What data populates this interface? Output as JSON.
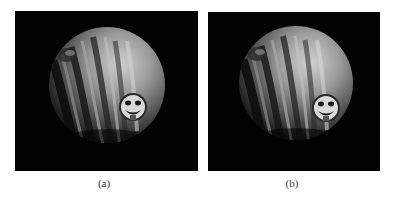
{
  "figure": {
    "subfigures": [
      {
        "id": "a",
        "caption": "(a)",
        "content": "rendered sphere with tentacle-like ridges and smiley face emblem"
      },
      {
        "id": "b",
        "caption": "(b)",
        "content": "rendered sphere with tentacle-like ridges and smiley face emblem"
      }
    ]
  },
  "colors": {
    "panel_background": "#020202",
    "sphere_light": "#c8c8c8",
    "sphere_mid": "#7a7a7a",
    "sphere_dark": "#1a1a1a",
    "page_background": "#ffffff"
  }
}
